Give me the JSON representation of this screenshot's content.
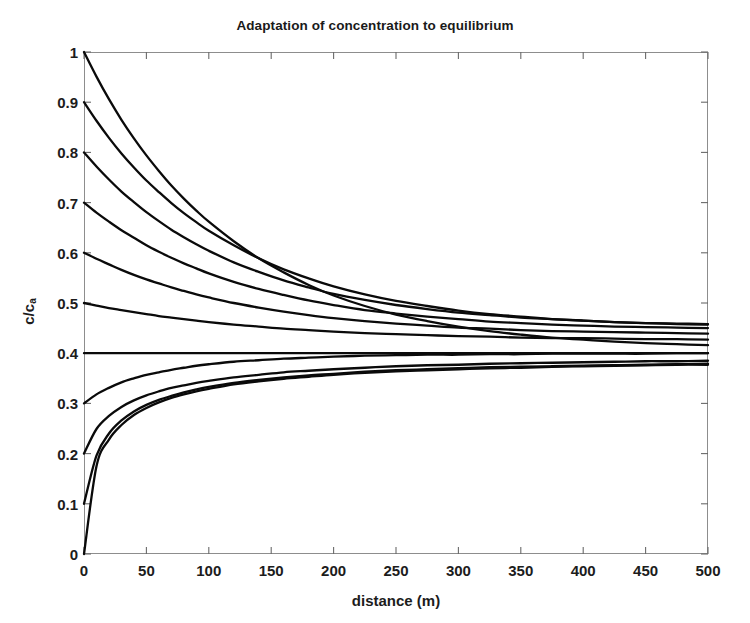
{
  "chart_data": {
    "type": "line",
    "title": "Adaptation of concentration to equilibrium",
    "xlabel": "distance (m)",
    "ylabel_main": "c/c",
    "ylabel_sub": "a",
    "ylabel": "c/c_a",
    "xlim": [
      0,
      500
    ],
    "ylim": [
      0,
      1
    ],
    "xticks": [
      0,
      50,
      100,
      150,
      200,
      250,
      300,
      350,
      400,
      450,
      500
    ],
    "xtick_labels": [
      "0",
      "50",
      "100",
      "150",
      "200",
      "250",
      "300",
      "350",
      "400",
      "450",
      "500"
    ],
    "yticks": [
      0,
      0.1,
      0.2,
      0.3,
      0.4,
      0.5,
      0.6,
      0.7,
      0.8,
      0.9,
      1
    ],
    "ytick_labels": [
      "0",
      "0.1",
      "0.2",
      "0.3",
      "0.4",
      "0.5",
      "0.6",
      "0.7",
      "0.8",
      "0.9",
      "1"
    ],
    "grid": false,
    "legend": null,
    "line_color": "#0a0a0a",
    "frame_color": "#8d8d8d",
    "background": "#ffffff",
    "equilibrium_value": 0.4,
    "x": [
      0,
      10,
      20,
      30,
      40,
      50,
      60,
      70,
      80,
      90,
      100,
      120,
      140,
      160,
      180,
      200,
      225,
      250,
      275,
      300,
      325,
      350,
      375,
      400,
      425,
      450,
      475,
      500
    ],
    "series": [
      {
        "name": "c0 = 1.0",
        "initial_value": 1.0,
        "values": [
          1.0,
          0.951,
          0.906,
          0.865,
          0.828,
          0.794,
          0.763,
          0.734,
          0.708,
          0.684,
          0.662,
          0.623,
          0.589,
          0.561,
          0.536,
          0.515,
          0.494,
          0.477,
          0.464,
          0.453,
          0.444,
          0.437,
          0.431,
          0.427,
          0.423,
          0.42,
          0.418,
          0.416
        ]
      },
      {
        "name": "c0 = 0.9",
        "initial_value": 0.9,
        "values": [
          0.9,
          0.863,
          0.829,
          0.798,
          0.77,
          0.744,
          0.721,
          0.699,
          0.679,
          0.661,
          0.644,
          0.615,
          0.589,
          0.567,
          0.549,
          0.533,
          0.517,
          0.504,
          0.494,
          0.485,
          0.478,
          0.473,
          0.468,
          0.465,
          0.462,
          0.46,
          0.458,
          0.457
        ]
      },
      {
        "name": "c0 = 0.8",
        "initial_value": 0.8,
        "values": [
          0.8,
          0.772,
          0.746,
          0.722,
          0.701,
          0.681,
          0.663,
          0.646,
          0.631,
          0.617,
          0.604,
          0.581,
          0.562,
          0.545,
          0.531,
          0.518,
          0.506,
          0.496,
          0.488,
          0.481,
          0.476,
          0.471,
          0.468,
          0.465,
          0.462,
          0.46,
          0.459,
          0.458
        ]
      },
      {
        "name": "c0 = 0.7",
        "initial_value": 0.7,
        "values": [
          0.7,
          0.68,
          0.662,
          0.645,
          0.63,
          0.615,
          0.602,
          0.59,
          0.579,
          0.569,
          0.559,
          0.542,
          0.528,
          0.516,
          0.505,
          0.496,
          0.486,
          0.479,
          0.473,
          0.468,
          0.463,
          0.46,
          0.457,
          0.455,
          0.453,
          0.452,
          0.451,
          0.45
        ]
      },
      {
        "name": "c0 = 0.6",
        "initial_value": 0.6,
        "values": [
          0.6,
          0.588,
          0.577,
          0.566,
          0.556,
          0.547,
          0.539,
          0.531,
          0.524,
          0.517,
          0.511,
          0.5,
          0.491,
          0.483,
          0.476,
          0.47,
          0.464,
          0.459,
          0.455,
          0.451,
          0.449,
          0.446,
          0.444,
          0.443,
          0.442,
          0.441,
          0.44,
          0.439
        ]
      },
      {
        "name": "c0 = 0.5",
        "initial_value": 0.5,
        "values": [
          0.5,
          0.495,
          0.49,
          0.486,
          0.482,
          0.478,
          0.474,
          0.471,
          0.468,
          0.465,
          0.462,
          0.457,
          0.453,
          0.449,
          0.446,
          0.443,
          0.44,
          0.438,
          0.436,
          0.434,
          0.433,
          0.431,
          0.43,
          0.43,
          0.429,
          0.428,
          0.428,
          0.427
        ]
      },
      {
        "name": "c0 = 0.4 (equilibrium)",
        "initial_value": 0.4,
        "values": [
          0.4,
          0.4,
          0.4,
          0.4,
          0.4,
          0.4,
          0.4,
          0.4,
          0.4,
          0.4,
          0.4,
          0.4,
          0.4,
          0.4,
          0.4,
          0.4,
          0.4,
          0.4,
          0.4,
          0.4,
          0.4,
          0.4,
          0.4,
          0.4,
          0.4,
          0.4,
          0.4,
          0.4
        ]
      },
      {
        "name": "c0 = 0.3",
        "initial_value": 0.3,
        "values": [
          0.3,
          0.318,
          0.331,
          0.342,
          0.35,
          0.357,
          0.362,
          0.367,
          0.371,
          0.375,
          0.378,
          0.383,
          0.386,
          0.389,
          0.391,
          0.393,
          0.395,
          0.396,
          0.397,
          0.397,
          0.398,
          0.398,
          0.399,
          0.399,
          0.399,
          0.399,
          0.4,
          0.4
        ]
      },
      {
        "name": "c0 = 0.2",
        "initial_value": 0.2,
        "values": [
          0.2,
          0.249,
          0.275,
          0.293,
          0.306,
          0.316,
          0.324,
          0.331,
          0.336,
          0.341,
          0.345,
          0.352,
          0.357,
          0.362,
          0.365,
          0.368,
          0.371,
          0.374,
          0.376,
          0.377,
          0.379,
          0.38,
          0.381,
          0.382,
          0.383,
          0.384,
          0.384,
          0.385
        ]
      },
      {
        "name": "c0 = 0.1",
        "initial_value": 0.1,
        "values": [
          0.1,
          0.196,
          0.24,
          0.266,
          0.284,
          0.297,
          0.307,
          0.315,
          0.322,
          0.328,
          0.333,
          0.341,
          0.347,
          0.352,
          0.356,
          0.359,
          0.363,
          0.366,
          0.368,
          0.37,
          0.372,
          0.373,
          0.374,
          0.375,
          0.376,
          0.377,
          0.378,
          0.379
        ]
      },
      {
        "name": "c0 = 0.0",
        "initial_value": 0.0,
        "values": [
          0.0,
          0.175,
          0.228,
          0.257,
          0.277,
          0.291,
          0.302,
          0.311,
          0.318,
          0.324,
          0.329,
          0.338,
          0.344,
          0.349,
          0.353,
          0.357,
          0.361,
          0.364,
          0.366,
          0.368,
          0.37,
          0.371,
          0.373,
          0.374,
          0.375,
          0.376,
          0.377,
          0.377
        ]
      }
    ]
  }
}
